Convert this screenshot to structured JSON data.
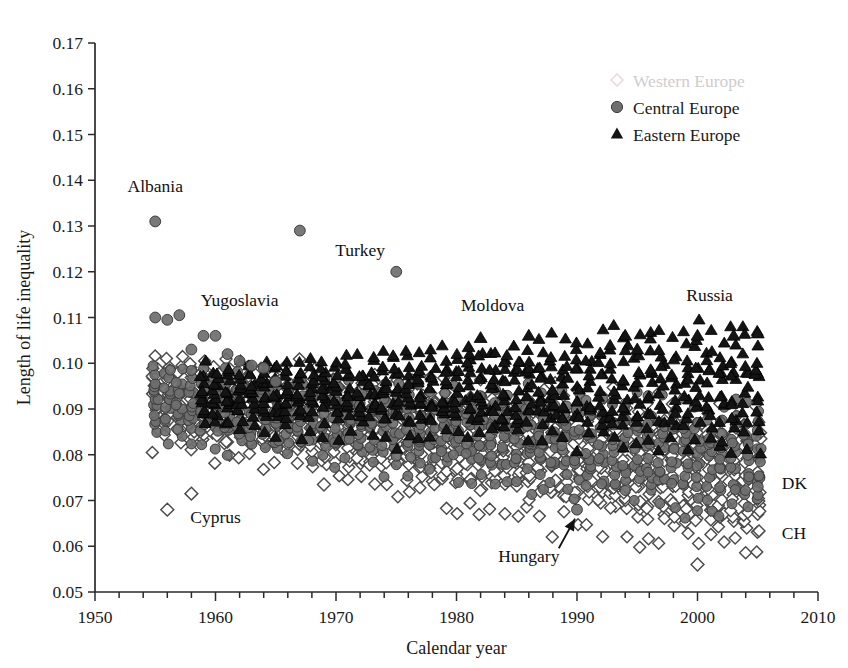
{
  "panel": {
    "title": "B. Females"
  },
  "legend": {
    "position": "top-right",
    "entries": [
      {
        "label": "Western Europe",
        "marker": "open-diamond",
        "color": "#cfcbcd",
        "faded": true
      },
      {
        "label": "Central Europe",
        "marker": "filled-circle",
        "color": "#6e6e6e",
        "faded": false
      },
      {
        "label": "Eastern Europe",
        "marker": "filled-triangle",
        "color": "#141414",
        "faded": false
      }
    ]
  },
  "chart_data": {
    "type": "scatter",
    "title": "B. Females",
    "xlabel": "Calendar year",
    "ylabel": "Length of life inequality",
    "xlim": [
      1950,
      2010
    ],
    "ylim": [
      0.05,
      0.17
    ],
    "xticks": [
      1950,
      1960,
      1970,
      1980,
      1990,
      2000,
      2010
    ],
    "xtick_labels": [
      "1950",
      "1960",
      "1970",
      "1980",
      "1990",
      "2000",
      "2010"
    ],
    "xminor_step": 2,
    "yticks": [
      0.05,
      0.06,
      0.07,
      0.08,
      0.09,
      0.1,
      0.11,
      0.12,
      0.13,
      0.14,
      0.15,
      0.16,
      0.17
    ],
    "ytick_labels": [
      "0.05",
      "0.06",
      "0.07",
      "0.08",
      "0.09",
      "0.10",
      "0.11",
      "0.12",
      "0.13",
      "0.14",
      "0.15",
      "0.16",
      "0.17"
    ],
    "grid": false,
    "series": [
      {
        "name": "Western Europe",
        "marker": "open-diamond",
        "color": "#ffffff",
        "edge": "#4a4a4a",
        "band": {
          "years": [
            1955,
            2005
          ],
          "upper": [
            0.1,
            0.086
          ],
          "lower": [
            0.085,
            0.062
          ],
          "spread_start": 0.015,
          "spread_end": 0.024
        },
        "outliers": [
          {
            "x": 1956,
            "y": 0.068,
            "label": "Cyprus"
          },
          {
            "x": 1958,
            "y": 0.0715,
            "label": "Cyprus"
          },
          {
            "x": 2000,
            "y": 0.056,
            "label": ""
          },
          {
            "x": 1969,
            "y": 0.0735,
            "label": ""
          }
        ]
      },
      {
        "name": "Central Europe",
        "marker": "filled-circle",
        "color": "#6e6e6e",
        "edge": "#3c3c3c",
        "band": {
          "years": [
            1955,
            2005
          ],
          "upper": [
            0.098,
            0.088
          ],
          "lower": [
            0.086,
            0.07
          ],
          "spread_start": 0.012,
          "spread_end": 0.018
        },
        "outliers": [
          {
            "x": 1955,
            "y": 0.131,
            "label": "Albania"
          },
          {
            "x": 1967,
            "y": 0.129,
            "label": "Turkey"
          },
          {
            "x": 1975,
            "y": 0.12,
            "label": "Turkey"
          },
          {
            "x": 1955,
            "y": 0.11,
            "label": "Yugoslavia"
          },
          {
            "x": 1956,
            "y": 0.1095,
            "label": "Yugoslavia"
          },
          {
            "x": 1957,
            "y": 0.1105,
            "label": "Yugoslavia"
          },
          {
            "x": 1959,
            "y": 0.106,
            "label": "Yugoslavia"
          },
          {
            "x": 1960,
            "y": 0.106,
            "label": "Yugoslavia"
          },
          {
            "x": 1958,
            "y": 0.103,
            "label": ""
          },
          {
            "x": 1961,
            "y": 0.102,
            "label": ""
          },
          {
            "x": 1962,
            "y": 0.1005,
            "label": ""
          },
          {
            "x": 1963,
            "y": 0.0995,
            "label": ""
          },
          {
            "x": 1964,
            "y": 0.099,
            "label": ""
          },
          {
            "x": 1965,
            "y": 0.096,
            "label": ""
          },
          {
            "x": 1990,
            "y": 0.068,
            "label": "Hungary"
          },
          {
            "x": 2005,
            "y": 0.073,
            "label": "DK"
          }
        ]
      },
      {
        "name": "Eastern Europe",
        "marker": "filled-triangle",
        "color": "#141414",
        "edge": "#000000",
        "band": {
          "years": [
            1959,
            2005
          ],
          "upper": [
            0.098,
            0.106
          ],
          "lower": [
            0.088,
            0.084
          ],
          "spread_start": 0.01,
          "spread_end": 0.022
        },
        "outliers": [
          {
            "x": 1981,
            "y": 0.1035,
            "label": "Moldova"
          },
          {
            "x": 1982,
            "y": 0.1055,
            "label": "Moldova"
          },
          {
            "x": 1986,
            "y": 0.106,
            "label": "Moldova"
          },
          {
            "x": 2000,
            "y": 0.106,
            "label": "Russia"
          },
          {
            "x": 2003,
            "y": 0.106,
            "label": "Russia"
          },
          {
            "x": 2005,
            "y": 0.1065,
            "label": "Russia"
          },
          {
            "x": 1994,
            "y": 0.106,
            "label": ""
          },
          {
            "x": 1995,
            "y": 0.103,
            "label": ""
          }
        ]
      }
    ],
    "annotations": [
      {
        "text": "Albania",
        "x": 1955,
        "y": 0.1375,
        "anchor": "middle",
        "points_to": null
      },
      {
        "text": "Turkey",
        "x": 1972,
        "y": 0.1235,
        "anchor": "middle",
        "points_to": null
      },
      {
        "text": "Yugoslavia",
        "x": 1962,
        "y": 0.1125,
        "anchor": "middle",
        "points_to": null
      },
      {
        "text": "Cyprus",
        "x": 1960,
        "y": 0.065,
        "anchor": "middle",
        "points_to": null
      },
      {
        "text": "Moldova",
        "x": 1983,
        "y": 0.1115,
        "anchor": "middle",
        "points_to": null
      },
      {
        "text": "Russia",
        "x": 2001,
        "y": 0.1135,
        "anchor": "middle",
        "points_to": null
      },
      {
        "text": "Hungary",
        "x": 1986,
        "y": 0.0565,
        "anchor": "middle",
        "points_to": {
          "x": 1990,
          "y": 0.068
        }
      },
      {
        "text": "DK",
        "x": 2007,
        "y": 0.0725,
        "anchor": "start",
        "points_to": null
      },
      {
        "text": "CH",
        "x": 2007,
        "y": 0.0615,
        "anchor": "start",
        "points_to": null
      }
    ]
  }
}
